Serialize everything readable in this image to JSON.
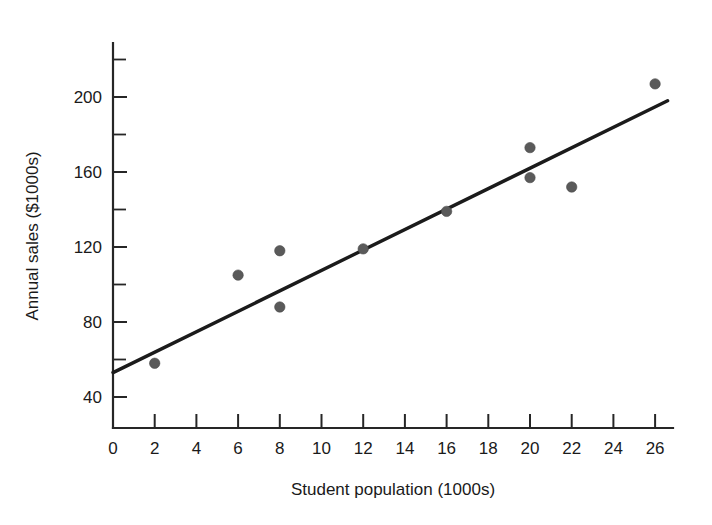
{
  "chart_data": {
    "type": "scatter",
    "title": "",
    "subtitle": "",
    "xlabel": "Student population (1000s)",
    "ylabel": "Annual sales ($1000s)",
    "xlim": [
      0,
      26.9
    ],
    "ylim": [
      28,
      215
    ],
    "grid": false,
    "legend": null,
    "x_ticks": [
      0,
      2,
      4,
      6,
      8,
      10,
      12,
      14,
      16,
      18,
      20,
      22,
      24,
      26
    ],
    "x_tick_labels": [
      "0",
      "2",
      "4",
      "6",
      "8",
      "10",
      "12",
      "14",
      "16",
      "18",
      "20",
      "22",
      "24",
      "26"
    ],
    "y_ticks": [
      40,
      80,
      120,
      160,
      200
    ],
    "y_tick_labels": [
      "40",
      "80",
      "120",
      "160",
      "200"
    ],
    "y_minor_ticks": [
      60,
      100,
      140,
      180,
      220
    ],
    "x": [
      2,
      6,
      8,
      8,
      12,
      16,
      20,
      20,
      22,
      26
    ],
    "y": [
      58,
      105,
      118,
      88,
      119,
      139,
      173,
      157,
      152,
      207
    ],
    "points": [
      {
        "x": 2,
        "y": 58
      },
      {
        "x": 6,
        "y": 105
      },
      {
        "x": 8,
        "y": 118
      },
      {
        "x": 8,
        "y": 88
      },
      {
        "x": 12,
        "y": 119
      },
      {
        "x": 16,
        "y": 139
      },
      {
        "x": 20,
        "y": 173
      },
      {
        "x": 20,
        "y": 157
      },
      {
        "x": 22,
        "y": 152
      },
      {
        "x": 26,
        "y": 207
      }
    ],
    "series": [
      {
        "name": "Observed sales",
        "type": "scatter",
        "marker": "filled-circle",
        "color": "#5a5a5a",
        "values": [
          58,
          105,
          118,
          88,
          119,
          139,
          173,
          157,
          152,
          207
        ]
      },
      {
        "name": "Estimated regression line",
        "type": "line",
        "color": "#1b1b1b",
        "x_start": 0,
        "y_start": 53,
        "x_end": 26.6,
        "y_end": 198
      }
    ],
    "regression_line": {
      "intercept": 53,
      "slope": 5.45,
      "x_start": 0,
      "y_start": 53,
      "x_end": 26.6,
      "y_end": 198
    },
    "annotations": []
  },
  "axes": {
    "x_axis_label": "Student population (1000s)",
    "y_axis_label": "Annual sales ($1000s)"
  },
  "colors": {
    "point": "#5a5a5a",
    "line": "#1b1b1b",
    "axis": "#262626",
    "text": "#1a1a1a",
    "background": "#ffffff"
  }
}
